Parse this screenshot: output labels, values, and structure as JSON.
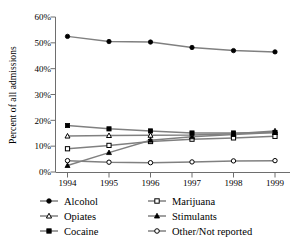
{
  "chart_data": {
    "type": "line",
    "title": "",
    "subtitle": "",
    "xlabel": "",
    "ylabel": "Percent of all admissions",
    "categories": [
      "1994",
      "1995",
      "1996",
      "1997",
      "1998",
      "1999"
    ],
    "x": [
      1994,
      1995,
      1996,
      1997,
      1998,
      1999
    ],
    "xlim": [
      1994,
      1999
    ],
    "ylim": [
      0,
      60
    ],
    "ytick_values": [
      0,
      10,
      20,
      30,
      40,
      50,
      60
    ],
    "ytick_labels": [
      "0%",
      "10%",
      "20%",
      "30%",
      "40%",
      "50%",
      "60%"
    ],
    "xtick_labels": [
      "1994",
      "1995",
      "1996",
      "1997",
      "1998",
      "1999"
    ],
    "grid": false,
    "legend_position": "bottom",
    "legend_columns": 2,
    "axis_spines": [
      "left",
      "bottom"
    ],
    "line_color": "#808080",
    "marker_color": "#000000",
    "series": [
      {
        "name": "Alcohol",
        "marker": "filled-circle",
        "values": [
          52.5,
          50.5,
          50.3,
          48.2,
          47.0,
          46.5
        ]
      },
      {
        "name": "Marijuana",
        "marker": "open-square",
        "values": [
          9.0,
          10.3,
          11.8,
          12.7,
          13.2,
          13.8
        ]
      },
      {
        "name": "Opiates",
        "marker": "open-triangle",
        "values": [
          13.9,
          14.1,
          14.2,
          14.3,
          14.8,
          15.9
        ]
      },
      {
        "name": "Stimulants",
        "marker": "filled-triangle",
        "values": [
          2.5,
          7.5,
          12.3,
          13.6,
          14.5,
          15.3
        ]
      },
      {
        "name": "Cocaine",
        "marker": "filled-square",
        "values": [
          18.0,
          16.7,
          15.9,
          15.1,
          15.1,
          15.3
        ]
      },
      {
        "name": "Other/Not reported",
        "marker": "open-circle",
        "values": [
          4.4,
          3.8,
          3.6,
          3.9,
          4.3,
          4.4
        ]
      }
    ]
  },
  "legend": {
    "entries": [
      {
        "label": "Alcohol",
        "marker": "filled-circle"
      },
      {
        "label": "Marijuana",
        "marker": "open-square"
      },
      {
        "label": "Opiates",
        "marker": "open-triangle"
      },
      {
        "label": "Stimulants",
        "marker": "filled-triangle"
      },
      {
        "label": "Cocaine",
        "marker": "filled-square"
      },
      {
        "label": "Other/Not reported",
        "marker": "open-circle"
      }
    ]
  }
}
